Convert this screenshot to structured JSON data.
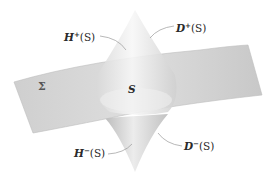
{
  "figure": {
    "labels": {
      "h_plus": {
        "base": "H",
        "sup": "+",
        "arg": "(S)"
      },
      "d_plus": {
        "base": "D",
        "sup": "+",
        "arg": "(S)"
      },
      "h_minus": {
        "base": "H",
        "sup": "−",
        "arg": "(S)"
      },
      "d_minus": {
        "base": "D",
        "sup": "−",
        "arg": "(S)"
      },
      "surface": "Σ",
      "set": "S"
    },
    "colors": {
      "sheet": "#d4d4d4",
      "sheet_edge": "#b8b8b8",
      "cone_light": "#f4f4f4",
      "cone_dark": "#c6c6c6",
      "leader": "#9a9a9a",
      "text": "#2a2a2a"
    }
  }
}
